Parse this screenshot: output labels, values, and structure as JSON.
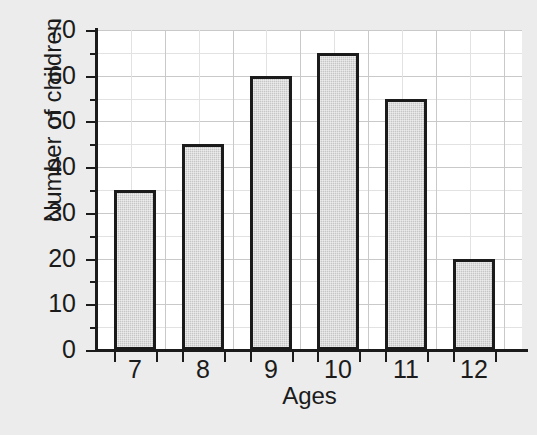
{
  "chart_data": {
    "type": "bar",
    "title": "",
    "subtitle": "",
    "xlabel": "Ages",
    "ylabel": "Number of children",
    "categories": [
      "7",
      "8",
      "9",
      "10",
      "11",
      "12"
    ],
    "values": [
      35,
      45,
      60,
      65,
      55,
      20
    ],
    "series": [
      {
        "name": "Number of children",
        "values": [
          35,
          45,
          60,
          65,
          55,
          20
        ]
      }
    ],
    "ylim": [
      0,
      70
    ],
    "y_tick_labels": [
      "0",
      "10",
      "20",
      "30",
      "40",
      "50",
      "60",
      "70"
    ],
    "y_tick_values": [
      0,
      10,
      20,
      30,
      40,
      50,
      60,
      70
    ],
    "y_major_step": 10,
    "y_minor_step": 5,
    "x_tick_labels": [
      "7",
      "8",
      "9",
      "10",
      "11",
      "12"
    ],
    "grid": true,
    "grid_minor": true,
    "legend": "none",
    "legend_position": "none",
    "annotations": [],
    "colors": {
      "bar_fill": "#c6c6c6",
      "bar_border": "#1b1b1b",
      "plot_background": "#ffffff",
      "figure_background": "#ececec",
      "gridline_major": "#c9c9c9",
      "gridline_minor": "#e2e2e2",
      "axis": "#1b1b1b",
      "text": "#1b1b1b"
    }
  }
}
